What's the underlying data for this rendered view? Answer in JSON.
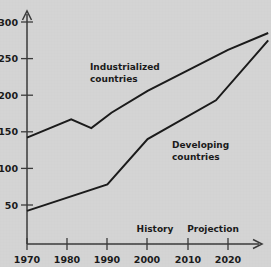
{
  "chart_data": {
    "type": "line",
    "title": "",
    "subtitle": "",
    "xlabel": "",
    "ylabel": "",
    "xlim": [
      1970,
      2031
    ],
    "ylim": [
      0,
      310
    ],
    "x_ticks": [
      1970,
      1980,
      1990,
      2000,
      2010,
      2020
    ],
    "x_tick_labels": [
      "1970",
      "1980",
      "1990",
      "2000",
      "2010",
      "2020"
    ],
    "y_ticks": [
      50,
      100,
      150,
      200,
      250,
      300
    ],
    "y_tick_labels": [
      "50",
      "100",
      "150",
      "200",
      "250",
      "300"
    ],
    "grid": false,
    "legend": "inline-annotations",
    "series": [
      {
        "name": "Industrialized countries",
        "label_text_line1": "Industrialized",
        "label_text_line2": "countries",
        "color": "#1a1a1a",
        "x": [
          1970,
          1981,
          1986,
          1991,
          2000,
          2010,
          2020,
          2030
        ],
        "values": [
          142,
          167,
          155,
          176,
          206,
          234,
          262,
          285
        ]
      },
      {
        "name": "Developing countries",
        "label_text_line1": "Developing",
        "label_text_line2": "countries",
        "color": "#1a1a1a",
        "x": [
          1970,
          1990,
          2000,
          2017,
          2030
        ],
        "values": [
          42,
          78,
          140,
          193,
          275
        ]
      }
    ],
    "annotations": [
      {
        "name": "history",
        "text": "History",
        "x": 2002,
        "y": 22
      },
      {
        "name": "projection",
        "text": "Projection",
        "x": 2017,
        "y": 22
      }
    ]
  },
  "axis": {
    "y_labels": [
      "300",
      "250",
      "200",
      "150",
      "100",
      "50"
    ],
    "x_labels": [
      "1970",
      "1980",
      "1990",
      "2000",
      "2010",
      "2020"
    ]
  },
  "series_labels": {
    "industrialized_line1": "Industrialized",
    "industrialized_line2": "countries",
    "developing_line1": "Developing",
    "developing_line2": "countries"
  },
  "phase_labels": {
    "history": "History",
    "projection": "Projection"
  },
  "colors": {
    "background": "#d4d4d4",
    "line": "#1a1a1a",
    "axis": "#3a3a3a",
    "text": "#1a1a1a"
  }
}
